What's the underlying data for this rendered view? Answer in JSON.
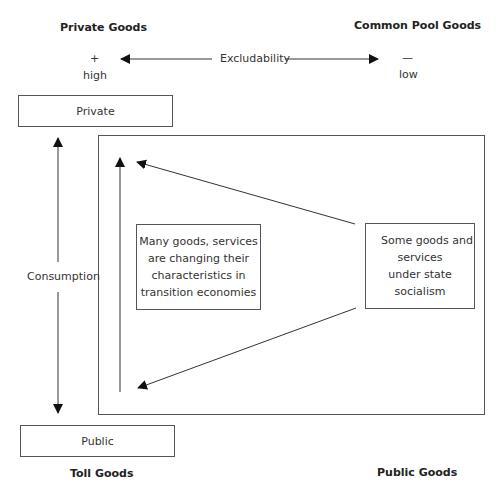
{
  "corners": {
    "top_left": "Private Goods",
    "top_right": "Common Pool Goods",
    "bottom_left": "Toll Goods",
    "bottom_right": "Public Goods"
  },
  "excludability_axis": {
    "label": "Excludability",
    "left_symbol": "+",
    "left_level": "high",
    "right_symbol": "—",
    "right_level": "low"
  },
  "consumption_axis": {
    "label": "Consumption",
    "top_box": "Private",
    "bottom_box": "Public"
  },
  "center_box": {
    "lines": [
      "Many goods, services",
      "are changing their",
      "characteristics in",
      "transition economies"
    ]
  },
  "right_box": {
    "lines": [
      "Some goods and",
      "services",
      "under state",
      "socialism"
    ]
  },
  "colors": {
    "line": "#333333",
    "box_border": "#555555",
    "text": "#222222"
  }
}
